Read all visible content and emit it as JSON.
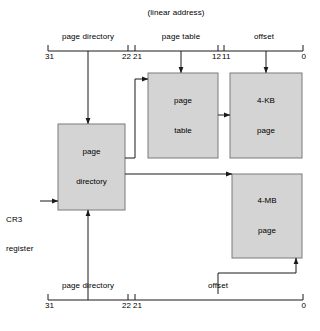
{
  "diagram": {
    "title": "(linear address)",
    "box_fill": "#d4d4d4",
    "box_stroke": "#7a7a7a",
    "line_color": "#1a1a1a",
    "background": "#ffffff"
  },
  "top_ruler": {
    "fields": [
      {
        "label": "page directory",
        "high_bit": "31",
        "low_bit": "22"
      },
      {
        "label": "page table",
        "high_bit": "21",
        "low_bit": "12"
      },
      {
        "label": "offset",
        "high_bit": "11",
        "low_bit": "0"
      }
    ]
  },
  "bottom_ruler": {
    "fields": [
      {
        "label": "page directory",
        "high_bit": "31",
        "low_bit": "22"
      },
      {
        "label": "offset",
        "high_bit": "21",
        "low_bit": "0"
      }
    ]
  },
  "boxes": [
    {
      "id": "page-directory",
      "line1": "page",
      "line2": "directory"
    },
    {
      "id": "page-table",
      "line1": "page",
      "line2": "table"
    },
    {
      "id": "four-kb-page",
      "line1": "4-KB",
      "line2": "page"
    },
    {
      "id": "four-mb-page",
      "line1": "4-MB",
      "line2": "page"
    }
  ],
  "annotations": {
    "cr3": {
      "line1": "CR3",
      "line2": "register"
    }
  }
}
